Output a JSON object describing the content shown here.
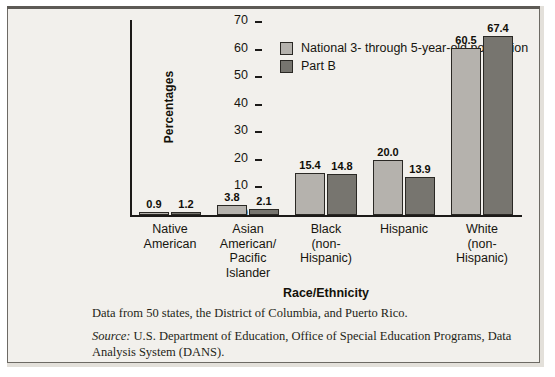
{
  "chart_data": {
    "type": "bar",
    "title": "",
    "xlabel": "Race/Ethnicity",
    "ylabel": "Percentages",
    "ylim": [
      0,
      70
    ],
    "yticks": [
      70,
      60,
      50,
      40,
      30,
      20,
      10,
      0
    ],
    "grid": false,
    "legend_position": "top-left-inside",
    "categories": [
      "Native\nAmerican",
      "Asian\nAmerican/\nPacific\nIslander",
      "Black\n(non-\nHispanic)",
      "Hispanic",
      "White\n(non-\nHispanic)"
    ],
    "series": [
      {
        "name": "National 3- through 5-year-old population",
        "color": "#b5b2ad",
        "values": [
          0.9,
          3.8,
          15.4,
          20.0,
          60.5
        ],
        "labels": [
          "0.9",
          "3.8",
          "15.4",
          "20.0",
          "60.5"
        ]
      },
      {
        "name": "Part B",
        "color": "#77756f",
        "values": [
          1.2,
          2.1,
          14.8,
          13.9,
          67.4
        ],
        "labels": [
          "1.2",
          "2.1",
          "14.8",
          "13.9",
          "67.4"
        ]
      }
    ],
    "notes": [
      {
        "source_word": "",
        "text": "Data from 50 states, the District of Columbia, and Puerto Rico."
      },
      {
        "source_word": "Source:",
        "text": " U.S. Department of Education, Office of Special Education Programs, Data Analysis System (DANS)."
      }
    ]
  }
}
